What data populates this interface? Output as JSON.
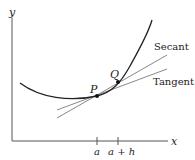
{
  "diagram": {
    "axes": {
      "x_label": "x",
      "y_label": "y"
    },
    "points": [
      {
        "label": "P",
        "x_tick": "a"
      },
      {
        "label": "Q",
        "x_tick": "a + h"
      }
    ],
    "lines": {
      "secant_label": "Secant",
      "tangent_label": "Tangent"
    },
    "ticks": {
      "a": "a",
      "a_plus_h": "a + h"
    },
    "colors": {
      "curve": "#222222",
      "lines": "#888888",
      "axes": "#555555"
    }
  }
}
